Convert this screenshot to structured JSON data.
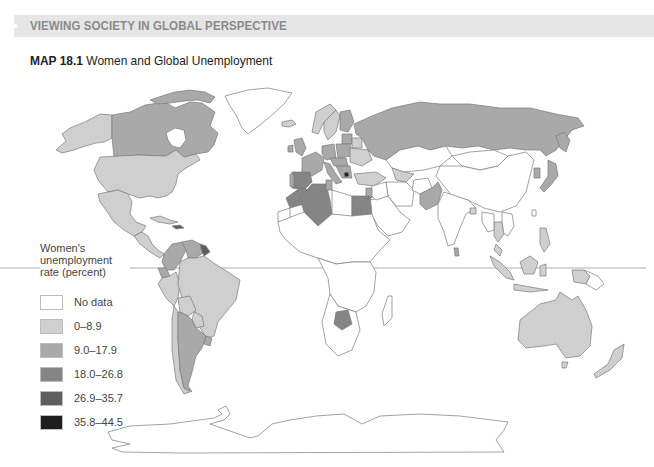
{
  "header": {
    "section_label": "VIEWING SOCIETY IN GLOBAL PERSPECTIVE"
  },
  "map": {
    "number": "MAP 18.1",
    "title": "Women and Global Unemployment"
  },
  "legend": {
    "title": "Women's unemployment rate (percent)",
    "items": [
      {
        "label": "No data",
        "color": "#ffffff"
      },
      {
        "label": "0–8.9",
        "color": "#cfcfcf"
      },
      {
        "label": "9.0–17.9",
        "color": "#a9a9a9"
      },
      {
        "label": "18.0–26.8",
        "color": "#858585"
      },
      {
        "label": "26.9–35.7",
        "color": "#5e5e5e"
      },
      {
        "label": "35.8–44.5",
        "color": "#1e1e1e"
      }
    ]
  },
  "colors": {
    "no_data": "#ffffff",
    "c1": "#cfcfcf",
    "c2": "#a9a9a9",
    "c3": "#858585",
    "c4": "#5e5e5e",
    "c5": "#1e1e1e",
    "border": "#7a7a7a",
    "header_band": "#e6e6e6",
    "header_text": "#8a8a8a"
  }
}
